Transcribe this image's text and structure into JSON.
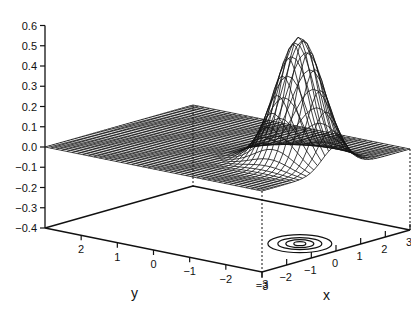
{
  "chart_data": {
    "type": "surface3d",
    "title": "",
    "function": "bivariate normal density, peak ≈ 0.62 at (x=0, y=-2)",
    "xlabel": "x",
    "ylabel": "y",
    "zlabel": "",
    "x_ticks": [
      "-3",
      "-2",
      "-1",
      "0",
      "1",
      "2",
      "3"
    ],
    "y_ticks": [
      "2",
      "1",
      "0",
      "-1",
      "-2",
      "-3"
    ],
    "z_ticks": [
      "0.6",
      "0.5",
      "0.4",
      "0.3",
      "0.2",
      "0.1",
      "0.0",
      "-0.1",
      "-0.2",
      "-0.3",
      "-0.4"
    ],
    "xlim": [
      -3,
      3
    ],
    "ylim": [
      -3,
      3
    ],
    "zlim": [
      -0.4,
      0.6
    ],
    "peak": {
      "x": 0,
      "y": -2,
      "z": 0.62
    },
    "contour_plane_z": -0.4,
    "contour_levels": 4,
    "grid": false,
    "legend": "none"
  },
  "axes": {
    "x_title": "x",
    "y_title": "y"
  }
}
